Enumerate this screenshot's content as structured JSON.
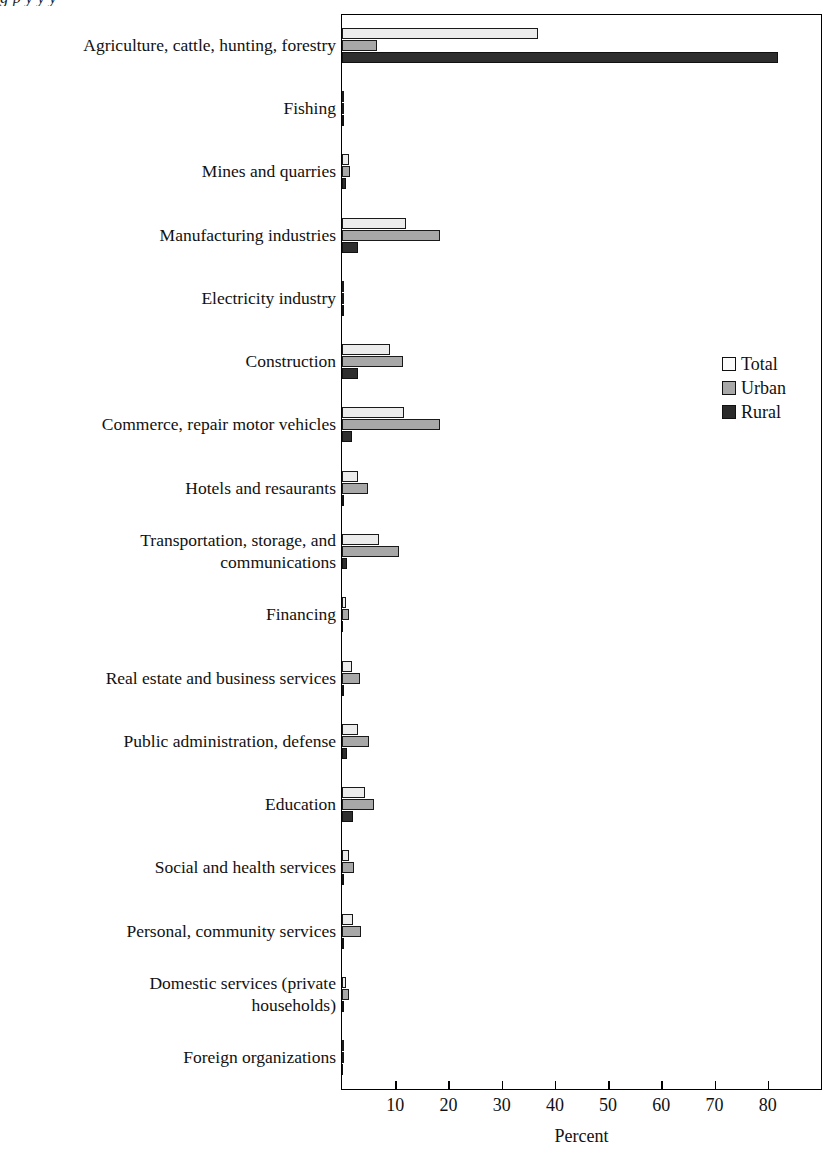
{
  "figure": {
    "title_remnant": "g                 p  y            y                                                        y",
    "xlabel": "Percent"
  },
  "legend": {
    "position": "right-middle",
    "items": [
      {
        "label": "Total",
        "color": "#ececec",
        "name": "legend-total"
      },
      {
        "label": "Urban",
        "color": "#a8a8a8",
        "name": "legend-urban"
      },
      {
        "label": "Rural",
        "color": "#2e2e2e",
        "name": "legend-rural"
      }
    ]
  },
  "axis": {
    "ticks": [
      {
        "value": 10,
        "label": "10"
      },
      {
        "value": 20,
        "label": "20"
      },
      {
        "value": 30,
        "label": "30"
      },
      {
        "value": 40,
        "label": "40"
      },
      {
        "value": 50,
        "label": "50"
      },
      {
        "value": 60,
        "label": "60"
      },
      {
        "value": 70,
        "label": "70"
      },
      {
        "value": 80,
        "label": "80"
      }
    ]
  },
  "chart_data": {
    "type": "bar",
    "orientation": "horizontal",
    "grouped": true,
    "title": "",
    "xlabel": "Percent",
    "ylabel": "",
    "xlim": [
      0,
      90
    ],
    "grid": false,
    "legend_position": "right",
    "categories": [
      "Agriculture, cattle, hunting, forestry",
      "Fishing",
      "Mines and quarries",
      "Manufacturing industries",
      "Electricity industry",
      "Construction",
      "Commerce, repair motor vehicles",
      "Hotels and resaurants",
      "Transportation, storage, and\ncommunications",
      "Financing",
      "Real estate and business services",
      "Public administration, defense",
      "Education",
      "Social and health services",
      "Personal, community services",
      "Domestic services (private\nhouseholds)",
      "Foreign organizations"
    ],
    "series": [
      {
        "name": "Total",
        "values": [
          36.8,
          0.2,
          1.3,
          12.0,
          0.2,
          9.0,
          11.7,
          3.0,
          7.0,
          0.8,
          1.8,
          3.0,
          4.3,
          1.3,
          2.0,
          0.7,
          0.1
        ]
      },
      {
        "name": "Urban",
        "values": [
          6.6,
          0.2,
          1.5,
          18.5,
          0.3,
          11.5,
          18.5,
          4.8,
          10.8,
          1.3,
          3.3,
          5.0,
          6.0,
          2.2,
          3.5,
          1.4,
          0.1
        ]
      },
      {
        "name": "Rural",
        "values": [
          82.0,
          0.2,
          0.8,
          3.0,
          0.1,
          3.0,
          1.8,
          0.3,
          1.0,
          0.0,
          0.2,
          1.0,
          2.0,
          0.3,
          0.4,
          0.1,
          0.0
        ]
      }
    ]
  }
}
